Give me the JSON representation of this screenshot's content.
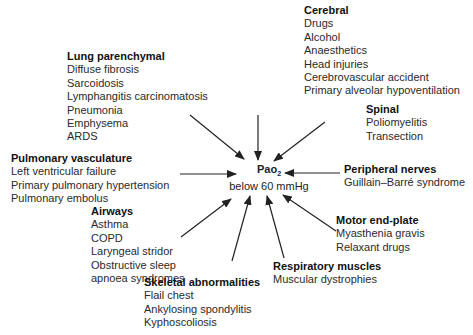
{
  "center": {
    "label_main": "Pao",
    "label_sub": "2",
    "subtitle": "below 60 mmHg"
  },
  "groups": {
    "cerebral": {
      "title": "Cerebral",
      "items": [
        "Drugs",
        "Alcohol",
        "Anaesthetics",
        "Head injuries",
        "Cerebrovascular accident",
        "Primary alveolar hypoventilation"
      ]
    },
    "lung_parenchymal": {
      "title": "Lung parenchymal",
      "items": [
        "Diffuse fibrosis",
        "Sarcoidosis",
        "Lymphangitis carcinomatosis",
        "Pneumonia",
        "Emphysema",
        "ARDS"
      ]
    },
    "spinal": {
      "title": "Spinal",
      "items": [
        "Poliomyelitis",
        "Transection"
      ]
    },
    "pulmonary_vasculature": {
      "title": "Pulmonary vasculature",
      "items": [
        "Left ventricular failure",
        "Primary pulmonary hypertension",
        "Pulmonary embolus"
      ]
    },
    "peripheral_nerves": {
      "title": "Peripheral nerves",
      "items": [
        "Guillain–Barré syndrome"
      ]
    },
    "airways": {
      "title": "Airways",
      "items": [
        "Asthma",
        "COPD",
        "Laryngeal stridor",
        "Obstructive sleep",
        "apnoea syndromes"
      ]
    },
    "motor_end_plate": {
      "title": "Motor end-plate",
      "items": [
        "Myasthenia gravis",
        "Relaxant drugs"
      ]
    },
    "respiratory_muscles": {
      "title": "Respiratory muscles",
      "items": [
        "Muscular dystrophies"
      ]
    },
    "skeletal_abnormalities": {
      "title": "Skeletal abnormalities",
      "items": [
        "Flail chest",
        "Ankylosing spondylitis",
        "Kyphoscoliosis"
      ]
    }
  },
  "colors": {
    "arrow": "#222222",
    "text": "#222222",
    "background": "#ffffff"
  }
}
